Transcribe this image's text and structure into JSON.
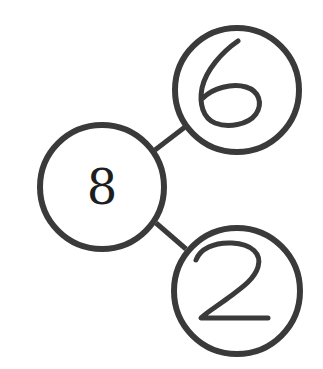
{
  "diagram": {
    "type": "number-bond",
    "whole": {
      "label": "8"
    },
    "parts": [
      {
        "label": "6",
        "position": "top-right",
        "style": "handwritten"
      },
      {
        "label": "2",
        "position": "bottom-right",
        "style": "handwritten"
      }
    ],
    "colors": {
      "stroke": "#3a3a3a",
      "text": "#1e1e1e",
      "background": "#ffffff"
    }
  }
}
